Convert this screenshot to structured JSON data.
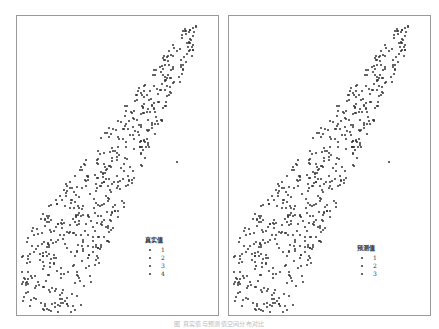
{
  "chart_data": [
    {
      "type": "scatter",
      "title": "",
      "panel": "left",
      "legend": {
        "title": "真实值",
        "entries": [
          "1",
          "2",
          "3",
          "4"
        ],
        "position": "lower right"
      },
      "xlabel": "",
      "ylabel": "",
      "grid": false,
      "axes_ticks": false,
      "description": "Dense diagonal band of small dark points running from lower-left to upper-right, wider in the lower half; one isolated outlier to the right of the band mid-height."
    },
    {
      "type": "scatter",
      "title": "",
      "panel": "right",
      "legend": {
        "title": "预测值",
        "entries": [
          "1",
          "2",
          "3"
        ],
        "position": "lower right"
      },
      "xlabel": "",
      "ylabel": "",
      "grid": false,
      "axes_ticks": false,
      "description": "Same spatial point distribution as the left panel, colored by predicted class."
    }
  ],
  "left": {
    "legend_title": "真实值",
    "legend_items": [
      "1",
      "2",
      "3",
      "4"
    ]
  },
  "right": {
    "legend_title": "预测值",
    "legend_items": [
      "1",
      "2",
      "3"
    ]
  },
  "caption": "图  真实值与预测值空间分布对比"
}
